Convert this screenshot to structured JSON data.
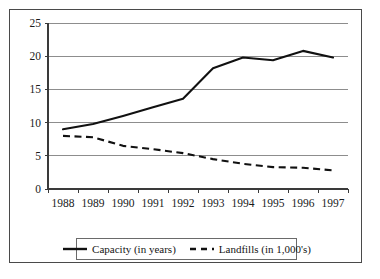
{
  "chart_data": {
    "type": "line",
    "title": "",
    "subtitle": "",
    "xlabel": "",
    "ylabel": "",
    "categories": [
      "1988",
      "1989",
      "1990",
      "1991",
      "1992",
      "1993",
      "1994",
      "1995",
      "1996",
      "1997"
    ],
    "x": [
      1988,
      1989,
      1990,
      1991,
      1992,
      1993,
      1994,
      1995,
      1996,
      1997
    ],
    "series": [
      {
        "name": "Capacity (in years)",
        "style": "solid",
        "color": "#111111",
        "values": [
          9.0,
          9.8,
          11.0,
          12.3,
          13.6,
          18.2,
          19.8,
          19.4,
          20.8,
          19.8
        ]
      },
      {
        "name": "Landfills (in 1,000's)",
        "style": "dashed",
        "color": "#111111",
        "values": [
          8.0,
          7.8,
          6.5,
          6.0,
          5.4,
          4.5,
          3.8,
          3.3,
          3.2,
          2.8
        ]
      }
    ],
    "yticks": [
      0,
      5,
      10,
      15,
      20,
      25
    ],
    "ytick_labels": [
      "0",
      "5",
      "10",
      "15",
      "20",
      "25"
    ],
    "ylim": [
      0,
      25
    ],
    "xlim": [
      1987.6,
      1997.4
    ],
    "grid": true,
    "grid_axis": "y",
    "legend_position": "bottom",
    "legend": [
      "Capacity (in years)",
      "Landfills (in 1,000's)"
    ]
  },
  "legend": {
    "items": [
      {
        "label": "Capacity (in years)",
        "marker": "solid-line-swatch"
      },
      {
        "label": "Landfills (in 1,000's)",
        "marker": "dashed-line-swatch"
      }
    ]
  },
  "page": {
    "artifact": ""
  }
}
